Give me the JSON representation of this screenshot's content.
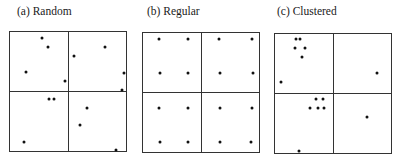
{
  "panels": [
    {
      "id": "a",
      "title": "(a) Random",
      "title_x": 17,
      "box": {
        "x1": 9,
        "y1": 31,
        "x2": 126,
        "y2": 151,
        "mx": 68,
        "my": 91
      },
      "points": [
        [
          42,
          38
        ],
        [
          48,
          47
        ],
        [
          26,
          72
        ],
        [
          65,
          81
        ],
        [
          74,
          56
        ],
        [
          105,
          47
        ],
        [
          124,
          73
        ],
        [
          122,
          90
        ],
        [
          49,
          99
        ],
        [
          54,
          99
        ],
        [
          87,
          108
        ],
        [
          80,
          125
        ],
        [
          24,
          142
        ],
        [
          116,
          150
        ]
      ]
    },
    {
      "id": "b",
      "title": "(b) Regular",
      "title_x": 147,
      "box": {
        "x1": 142,
        "y1": 32,
        "x2": 259,
        "y2": 152,
        "mx": 201,
        "my": 92
      },
      "points": [
        [
          159,
          39
        ],
        [
          188,
          39
        ],
        [
          219,
          39
        ],
        [
          252,
          39
        ],
        [
          160,
          73
        ],
        [
          188,
          73
        ],
        [
          220,
          73
        ],
        [
          253,
          73
        ],
        [
          159,
          108
        ],
        [
          188,
          108
        ],
        [
          220,
          108
        ],
        [
          252,
          108
        ],
        [
          160,
          142
        ],
        [
          188,
          142
        ],
        [
          220,
          142
        ],
        [
          251,
          142
        ]
      ]
    },
    {
      "id": "c",
      "title": "(c) Clustered",
      "title_x": 277,
      "box": {
        "x1": 274,
        "y1": 33,
        "x2": 391,
        "y2": 153,
        "mx": 333,
        "my": 93
      },
      "points": [
        [
          296,
          39
        ],
        [
          300,
          39
        ],
        [
          295,
          48
        ],
        [
          305,
          48
        ],
        [
          302,
          57
        ],
        [
          281,
          82
        ],
        [
          377,
          73
        ],
        [
          316,
          99
        ],
        [
          323,
          99
        ],
        [
          310,
          108
        ],
        [
          318,
          108
        ],
        [
          324,
          108
        ],
        [
          367,
          117
        ],
        [
          299,
          151
        ]
      ]
    }
  ],
  "style": {
    "line_color": "#333333",
    "point_color": "#111111",
    "point_radius": 1.5
  }
}
